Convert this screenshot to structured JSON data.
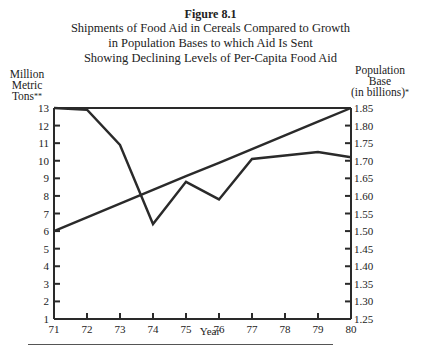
{
  "figure": {
    "label": "Figure 8.1",
    "title_lines": [
      "Shipments of Food Aid in Cereals Compared to Growth",
      "in Population Bases to which Aid Is Sent",
      "Showing Declining Levels of Per-Capita Food Aid"
    ]
  },
  "axes": {
    "left_title_lines": [
      "Million",
      "Metric",
      "Tons"
    ],
    "left_title_marker": "**",
    "right_title_lines": [
      "Population",
      "Base",
      "(in billions)"
    ],
    "right_title_marker": "*",
    "x_title": "Year"
  },
  "chart_data": {
    "type": "line",
    "title": "Shipments of Food Aid in Cereals Compared to Growth in Population Bases to which Aid Is Sent Showing Declining Levels of Per-Capita Food Aid",
    "xlabel": "Year",
    "ylabel": "Million Metric Tons**",
    "y2label": "Population Base (in billions)*",
    "x": [
      71,
      72,
      73,
      74,
      75,
      76,
      77,
      78,
      79,
      80
    ],
    "xlim": [
      71,
      80
    ],
    "ylim": [
      1,
      13
    ],
    "y2lim": [
      1.25,
      1.85
    ],
    "yticks": [
      1,
      2,
      3,
      4,
      5,
      6,
      7,
      8,
      9,
      10,
      11,
      12,
      13
    ],
    "y2ticks": [
      "1.25",
      "1.30",
      "1.35",
      "1.40",
      "1.45",
      "1.50",
      "1.55",
      "1.60",
      "1.65",
      "1.70",
      "1.75",
      "1.80",
      "1.85"
    ],
    "grid": false,
    "legend": null,
    "series": [
      {
        "name": "Food aid shipments in cereals (million metric tons)",
        "axis": "left",
        "values": [
          13.0,
          12.9,
          10.9,
          6.4,
          8.8,
          7.8,
          10.1,
          10.3,
          10.5,
          10.2
        ]
      },
      {
        "name": "Population base (billions)",
        "axis": "right",
        "values": [
          1.5,
          1.539,
          1.578,
          1.617,
          1.656,
          1.694,
          1.733,
          1.772,
          1.811,
          1.85
        ]
      }
    ]
  },
  "footer": {
    "rule": true
  }
}
